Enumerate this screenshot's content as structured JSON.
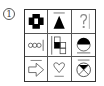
{
  "puzzle": {
    "number_label": "1",
    "cells": [
      {
        "row": 1,
        "col": 1,
        "shape": "thick-black-cross-square"
      },
      {
        "row": 1,
        "col": 2,
        "shape": "black-triangle-with-line"
      },
      {
        "row": 1,
        "col": 3,
        "shape": "question-mark"
      },
      {
        "row": 2,
        "col": 1,
        "shape": "three-circles-with-line"
      },
      {
        "row": 2,
        "col": 2,
        "shape": "split-squares-one-black"
      },
      {
        "row": 2,
        "col": 3,
        "shape": "half-black-circle-with-line"
      },
      {
        "row": 3,
        "col": 1,
        "shape": "arrow-right-outline-with-line"
      },
      {
        "row": 3,
        "col": 2,
        "shape": "heart-outline-with-line"
      },
      {
        "row": 3,
        "col": 3,
        "shape": "circle-x-black-top-with-line"
      }
    ],
    "colors": {
      "ink": "#000000",
      "grid": "#555555",
      "background": "#ffffff"
    }
  }
}
